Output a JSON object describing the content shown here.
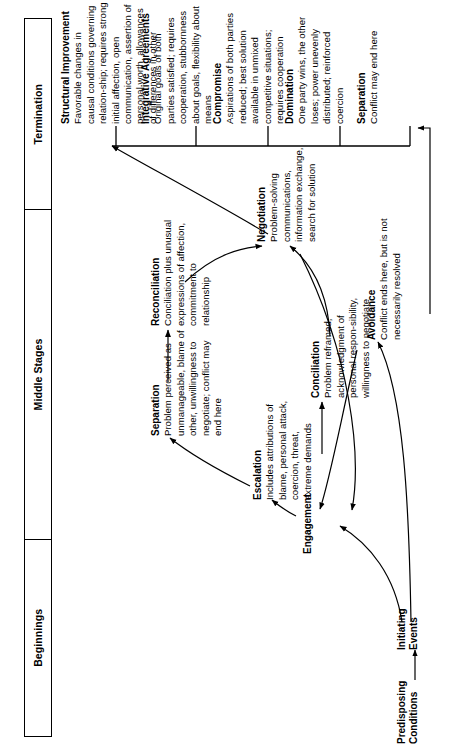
{
  "figure": {
    "kind": "conflict-process-flow-diagram",
    "orientation": "rotated-90-ccw"
  },
  "phases": [
    {
      "id": "beginnings",
      "label": "Beginnings"
    },
    {
      "id": "middle",
      "label": "Middle Stages"
    },
    {
      "id": "termination",
      "label": "Termination"
    }
  ],
  "nodes": {
    "predisposing": {
      "line1": "Predisposing",
      "line2": "Conditions"
    },
    "initiating": {
      "line1": "Initiating",
      "line2": "Events"
    },
    "engagement": {
      "title": "Engagement",
      "body": ""
    },
    "escalation": {
      "title": "Escalation",
      "body": "Includes attributions of blame, personal attack, coercion, threat, extreme demands"
    },
    "conciliation": {
      "title": "Conciliation",
      "body": "Problem reframed, acknowledgment of personal respon-sibility, willingness to negotiate"
    },
    "separation_mid": {
      "title": "Separation",
      "body": "Problem perceived as unmanageable, blame of other, unwillingness to negotiate; conflict may end here"
    },
    "reconciliation": {
      "title": "Reconciliation",
      "body": "Conciliation plus unusual expressions of affection, commitment to relationship"
    },
    "negotiation": {
      "title": "Negotiation",
      "body": "Problem-solving communications, information exchange, search for solution"
    },
    "avoidance": {
      "title": "Avoidance",
      "body": "Conflict ends here, but is not necessarily resolved"
    },
    "structural_improvement": {
      "title": "Structural Improvement",
      "body": "Favorable changes in causal conditions governing relation-ship; requires strong initial affection, open communication, assertion of personal worth, allowances of differences in other"
    },
    "integrative_agreements": {
      "title": "Integrative Agreements",
      "body": "Original goals of both parties satisfied; requires cooperation, stubbornness about goals, flexibility about means"
    },
    "compromise": {
      "title": "Compromise",
      "body": "Aspirations of both parties reduced; best solution available in unmixed competitive situations; requires cooperation"
    },
    "domination": {
      "title": "Domination",
      "body": "One party wins, the other loses; power unevenly distributed; reinforced coercion"
    },
    "separation_end": {
      "title": "Separation",
      "body": "Conflict may end here"
    }
  },
  "colors": {
    "ink": "#000000",
    "paper": "#ffffff"
  }
}
